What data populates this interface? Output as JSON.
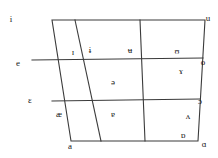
{
  "chart_data": {
    "type": "scatter",
    "title": "",
    "xlabel": "",
    "ylabel": "",
    "grid": true,
    "legend": "none",
    "axis_height_levels": [
      "close",
      "close-mid",
      "open-mid",
      "open"
    ],
    "axis_backness_levels": [
      "front",
      "near-front",
      "central",
      "near-back",
      "back"
    ],
    "xlim": [
      0,
      218
    ],
    "ylim": [
      0,
      158
    ],
    "stroke_color": "#3a3a3a",
    "text_color": "#1a1a1a",
    "background": "#ffffff",
    "outline": {
      "top_left": [
        52,
        20
      ],
      "top_right": [
        205,
        20
      ],
      "bottom_right": [
        198,
        141
      ],
      "bottom_left": [
        71,
        141
      ]
    },
    "horizontal_lines": [
      {
        "name": "close-mid",
        "x1": 32,
        "y1": 60,
        "x2": 203,
        "y2": 58
      },
      {
        "name": "open-mid",
        "x1": 52,
        "y1": 101,
        "x2": 200,
        "y2": 99
      }
    ],
    "vertical_lines": [
      {
        "name": "near-front-divider",
        "x1": 75,
        "y1": 20,
        "x2": 101,
        "y2": 141
      },
      {
        "name": "central-divider",
        "x1": 140,
        "y1": 20,
        "x2": 145,
        "y2": 141
      }
    ],
    "points": [
      {
        "symbol": "i",
        "x": 11,
        "y": 19,
        "name": "close-front-unrounded"
      },
      {
        "symbol": "u",
        "x": 208,
        "y": 18,
        "name": "close-back-rounded"
      },
      {
        "symbol": "ɪ",
        "x": 73,
        "y": 52,
        "name": "near-close-near-front-unrounded"
      },
      {
        "symbol": "ɨ",
        "x": 90,
        "y": 50,
        "name": "close-central-unrounded"
      },
      {
        "symbol": "ʉ",
        "x": 130,
        "y": 50,
        "name": "close-central-rounded"
      },
      {
        "symbol": "ʊ",
        "x": 177,
        "y": 51,
        "name": "near-close-near-back-rounded"
      },
      {
        "symbol": "e",
        "x": 18,
        "y": 63,
        "name": "close-mid-front-unrounded"
      },
      {
        "symbol": "o",
        "x": 203,
        "y": 62,
        "name": "close-mid-back-rounded"
      },
      {
        "symbol": "ɤ",
        "x": 181,
        "y": 71,
        "name": "close-mid-back-unrounded"
      },
      {
        "symbol": "ə",
        "x": 113,
        "y": 82,
        "name": "mid-central-schwa"
      },
      {
        "symbol": "ɛ",
        "x": 30,
        "y": 100,
        "name": "open-mid-front-unrounded"
      },
      {
        "symbol": "ɔ",
        "x": 200,
        "y": 101,
        "name": "open-mid-back-rounded"
      },
      {
        "symbol": "æ",
        "x": 59,
        "y": 114,
        "name": "near-open-front-unrounded"
      },
      {
        "symbol": "ɐ",
        "x": 113,
        "y": 114,
        "name": "near-open-central"
      },
      {
        "symbol": "ʌ",
        "x": 188,
        "y": 116,
        "name": "open-mid-back-unrounded"
      },
      {
        "symbol": "ɒ",
        "x": 183,
        "y": 135,
        "name": "open-back-rounded"
      },
      {
        "symbol": "a",
        "x": 70,
        "y": 146,
        "name": "open-front-unrounded"
      },
      {
        "symbol": "ɑ",
        "x": 204,
        "y": 144,
        "name": "open-back-unrounded"
      }
    ]
  }
}
